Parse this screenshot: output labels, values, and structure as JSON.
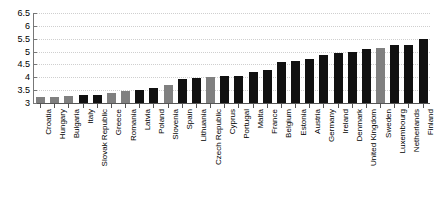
{
  "chart_data": {
    "type": "bar",
    "title": "",
    "subtitle": "",
    "xlabel": "",
    "ylabel": "",
    "ylim": [
      3,
      6.5
    ],
    "yticks": [
      "3",
      "3.5",
      "4",
      "4.5",
      "5",
      "5.5",
      "6",
      "6.5"
    ],
    "ytick_values": [
      3,
      3.5,
      4,
      4.5,
      5,
      5.5,
      6,
      6.5
    ],
    "grid": true,
    "legend": "none",
    "categories": [
      "Croatia",
      "Hungary",
      "Bulgaria",
      "Italy",
      "Slovak Republic",
      "Greece",
      "Romania",
      "Latvia",
      "Poland",
      "Slovenia",
      "Spain",
      "Lithuania",
      "Czech Republic",
      "Cyprus",
      "Portugal",
      "Malta",
      "France",
      "Belgium",
      "Estonia",
      "Austria",
      "Germany",
      "Ireland",
      "Denmark",
      "United Kingdom",
      "Sweden",
      "Luxembourg",
      "Netherlands",
      "Finland"
    ],
    "values": [
      3.25,
      3.25,
      3.27,
      3.3,
      3.32,
      3.4,
      3.45,
      3.5,
      3.58,
      3.7,
      3.95,
      3.97,
      4.0,
      4.05,
      4.05,
      4.2,
      4.3,
      4.6,
      4.65,
      4.7,
      4.85,
      4.95,
      4.97,
      5.1,
      5.15,
      5.25,
      5.25,
      5.5
    ],
    "bar_colors": [
      "#808080",
      "#808080",
      "#808080",
      "#111111",
      "#111111",
      "#808080",
      "#808080",
      "#111111",
      "#111111",
      "#808080",
      "#111111",
      "#111111",
      "#808080",
      "#111111",
      "#111111",
      "#111111",
      "#111111",
      "#111111",
      "#111111",
      "#111111",
      "#111111",
      "#111111",
      "#111111",
      "#111111",
      "#808080",
      "#111111",
      "#111111",
      "#111111"
    ],
    "colors": {
      "bar_black": "#111111",
      "bar_gray": "#808080",
      "grid": "#cfcfcf",
      "axis": "#666666",
      "background": "#ffffff",
      "text": "#000000"
    }
  }
}
